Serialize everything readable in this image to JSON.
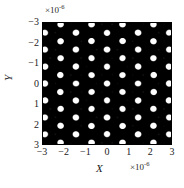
{
  "chart_data": {
    "type": "heatmap",
    "title": "",
    "subtitle": "",
    "xlabel": "X",
    "ylabel": "Y",
    "x_exponent_label": "×10",
    "x_exponent_power": "-6",
    "y_exponent_label": "×10",
    "y_exponent_power": "-6",
    "xticks": [
      "−3",
      "−2",
      "−1",
      "0",
      "1",
      "2",
      "3"
    ],
    "xtick_values": [
      -3,
      -2,
      -1,
      0,
      1,
      2,
      3
    ],
    "yticks": [
      "−3",
      "−2",
      "−1",
      "0",
      "1",
      "2",
      "3"
    ],
    "ytick_values": [
      -3,
      -2,
      -1,
      0,
      1,
      2,
      3
    ],
    "xlim": [
      -3,
      3
    ],
    "ylim": [
      -3,
      3
    ],
    "y_axis_inverted": true,
    "grid": false,
    "legend": false,
    "colormap": "gray",
    "value_min": 0,
    "value_max": 1,
    "background_color": "#000000",
    "feature_color": "#ffffff",
    "pattern": {
      "symmetry_fold": 6,
      "num_plane_waves": 6,
      "wavelength_um": 0.6328,
      "lattice_period_um": 0.73,
      "center_bullseye_rings": 3,
      "node_shape": "ring"
    }
  },
  "figure": {
    "width_px": 184,
    "height_px": 188,
    "plot_left_px": 42,
    "plot_top_px": 22,
    "plot_width_px": 130,
    "plot_height_px": 123
  }
}
